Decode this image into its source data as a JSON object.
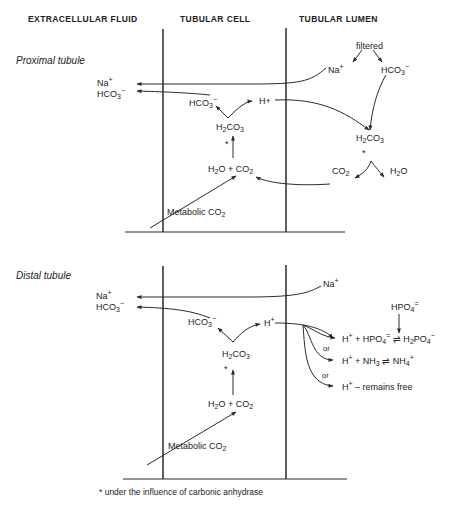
{
  "headers": {
    "extracellular": "EXTRACELLULAR FLUID",
    "cell": "TUBULAR CELL",
    "lumen": "TUBULAR LUMEN"
  },
  "proximal": {
    "title": "Proximal tubule",
    "filtered": "filtered",
    "lumen_na": {
      "base": "Na",
      "sup": "+"
    },
    "lumen_hco3": {
      "base": "HCO",
      "sub": "3",
      "sup": "−"
    },
    "ecf_na": {
      "base": "Na",
      "sup": "+"
    },
    "ecf_hco3": {
      "base": "HCO",
      "sub": "3",
      "sup": "−"
    },
    "cell_hco3": {
      "base": "HCO",
      "sub": "3",
      "sup": "−"
    },
    "cell_h": "H+",
    "cell_h2co3": {
      "a": "H",
      "b": "2",
      "c": "CO",
      "d": "3"
    },
    "cell_h2o_co2": {
      "a": "H",
      "b": "2",
      "c": "O + CO",
      "d": "2"
    },
    "lumen_h2co3": {
      "a": "H",
      "b": "2",
      "c": "CO",
      "d": "3"
    },
    "lumen_co2": {
      "a": "CO",
      "b": "2"
    },
    "lumen_h2o": {
      "a": "H",
      "b": "2",
      "c": "O"
    },
    "metabolic": {
      "a": "Metabolic CO",
      "b": "2"
    },
    "asterisk": "*"
  },
  "distal": {
    "title": "Distal tubule",
    "lumen_na": {
      "base": "Na",
      "sup": "+"
    },
    "ecf_na": {
      "base": "Na",
      "sup": "+"
    },
    "ecf_hco3": {
      "base": "HCO",
      "sub": "3",
      "sup": "−"
    },
    "cell_hco3": {
      "base": "HCO",
      "sub": "3",
      "sup": "−"
    },
    "cell_h": {
      "base": "H",
      "sup": "+"
    },
    "cell_h2co3": {
      "a": "H",
      "b": "2",
      "c": "CO",
      "d": "3"
    },
    "cell_h2o_co2": {
      "a": "H",
      "b": "2",
      "c": "O + CO",
      "d": "2"
    },
    "hpo4": {
      "base": "HPO",
      "sub": "4",
      "sup": "="
    },
    "reaction1": {
      "h": "H",
      "hsup": "+",
      "mid": " + HPO",
      "msub": "4",
      "msup": "=",
      "eq": " ⇌ H",
      "s1": "2",
      "po": "PO",
      "s2": "4",
      "s3": "−"
    },
    "reaction2": {
      "h": "H",
      "hsup": "+",
      "mid": " + NH",
      "msub": "3",
      "eq": " ⇌ NH",
      "s1": "4",
      "s3": "+"
    },
    "reaction3": {
      "h": "H",
      "hsup": "+",
      "rest": " – remains free"
    },
    "or1": "or",
    "or2": "or",
    "metabolic": {
      "a": "Metabolic CO",
      "b": "2"
    },
    "asterisk": "*"
  },
  "footnote": "* under the influence of carbonic anhydrase",
  "colors": {
    "line": "#2a2a2a",
    "text": "#222222"
  }
}
